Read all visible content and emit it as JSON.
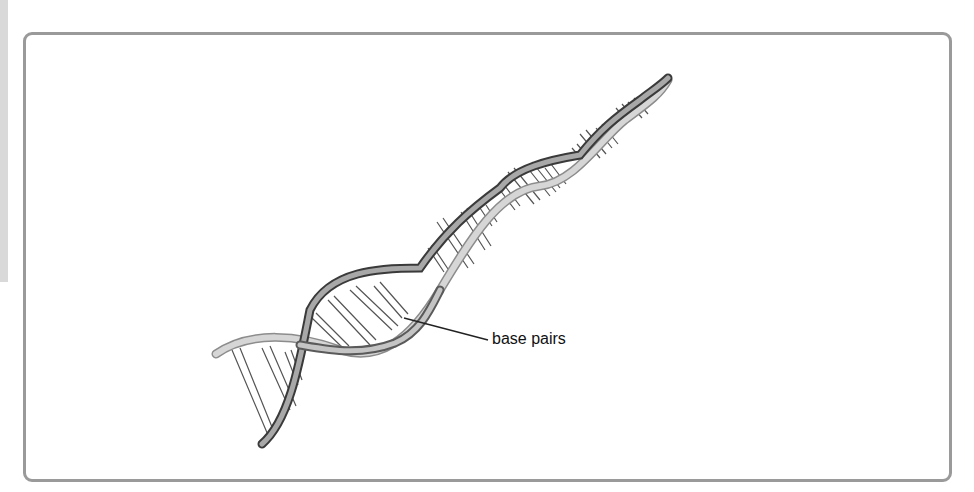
{
  "figure": {
    "labels": [
      {
        "text": "base pairs"
      }
    ],
    "colors": {
      "frame": "#9a9a9a",
      "strand": "#8c8c8c",
      "strand_dark": "#3a3a3a",
      "base_pair": "#555555",
      "background": "#ffffff"
    }
  }
}
